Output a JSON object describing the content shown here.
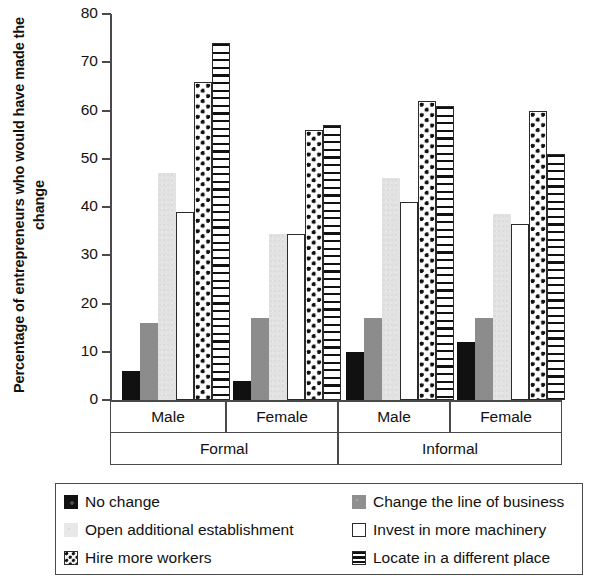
{
  "chart_data": {
    "type": "bar",
    "title": "",
    "xlabel": "",
    "ylabel": "Percentage of entrepreneurs who would have made the change",
    "ylim": [
      0,
      80
    ],
    "yticks": [
      0,
      10,
      20,
      30,
      40,
      50,
      60,
      70,
      80
    ],
    "grid": false,
    "legend_position": "bottom",
    "orientation": "vertical",
    "grouping": "grouped",
    "categories": [
      "Male",
      "Female",
      "Male",
      "Female"
    ],
    "supergroups": [
      {
        "label": "Formal",
        "categories": [
          "Male",
          "Female"
        ]
      },
      {
        "label": "Informal",
        "categories": [
          "Male",
          "Female"
        ]
      }
    ],
    "series": [
      {
        "name": "No change",
        "pattern": "solid-black",
        "values": [
          6,
          4,
          10,
          12
        ]
      },
      {
        "name": "Change the line of business",
        "pattern": "solid-gray",
        "values": [
          16,
          17,
          17,
          17
        ]
      },
      {
        "name": "Open additional establishment",
        "pattern": "light-gray",
        "values": [
          47,
          34.5,
          46,
          38.5
        ]
      },
      {
        "name": "Invest in more machinery",
        "pattern": "white-outline",
        "values": [
          39,
          34.5,
          41,
          36.5
        ]
      },
      {
        "name": "Hire more workers",
        "pattern": "checker",
        "values": [
          66,
          56,
          62,
          60
        ]
      },
      {
        "name": "Locate in a different place",
        "pattern": "horizontal-stripe",
        "values": [
          74,
          57,
          61,
          51
        ]
      }
    ]
  },
  "axis": {
    "y_title": "Percentage of entrepreneurs who would have made the change",
    "tick_labels": [
      "80",
      "70",
      "60",
      "50",
      "40",
      "30",
      "20",
      "10",
      "0"
    ]
  },
  "legend": {
    "items": [
      {
        "label": "No change",
        "swatch": "solid-black-swatch"
      },
      {
        "label": "Change the line of business",
        "swatch": "solid-gray-swatch"
      },
      {
        "label": "Open additional establishment",
        "swatch": "light-gray-swatch"
      },
      {
        "label": "Invest in more machinery",
        "swatch": "white-outline-swatch"
      },
      {
        "label": "Hire more workers",
        "swatch": "checker-swatch"
      },
      {
        "label": "Locate in a different place",
        "swatch": "horizontal-stripe-swatch"
      }
    ]
  },
  "colors": {
    "series_black": "#111111",
    "series_gray": "#8c8c8c",
    "series_light_gray": "#e2e2e2",
    "series_white": "#ffffff",
    "axis": "#4a4a4a"
  }
}
